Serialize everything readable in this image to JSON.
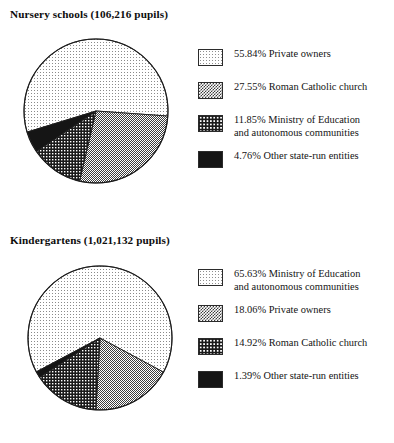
{
  "page": {
    "background": "#ffffff",
    "ink": "#111111"
  },
  "chart_data": [
    {
      "type": "pie",
      "id": "nursery-schools",
      "title": "Nursery schools (106,216 pupils)",
      "title_subject": "Nursery schools",
      "title_count": "106,216 pupils",
      "total_pupils": 106216,
      "legend_position": "right",
      "start_angle_deg": 163,
      "direction": "clockwise",
      "categories": [
        "Private owners",
        "Roman Catholic church",
        "Ministry of Education and autonomous communities",
        "Other state-run entities"
      ],
      "values": [
        55.84,
        27.55,
        11.85,
        4.76
      ],
      "value_labels": [
        "55.84%",
        "27.55%",
        "11.85%",
        "4.76%"
      ],
      "units": "percent",
      "slices": [
        {
          "label": "Private owners",
          "value": 55.84,
          "value_label": "55.84%",
          "pattern": "light-dots",
          "fill": "#e3e3e3"
        },
        {
          "label": "Roman Catholic church",
          "value": 27.55,
          "value_label": "27.55%",
          "pattern": "medium-checker",
          "fill": "#9a9a9a"
        },
        {
          "label": "Ministry of Education and autonomous communities",
          "label_line1": "Ministry of Education",
          "label_line2": "and autonomous communities",
          "value": 11.85,
          "value_label": "11.85%",
          "pattern": "dark-checker",
          "fill": "#3a3a3a"
        },
        {
          "label": "Other state-run entities",
          "value": 4.76,
          "value_label": "4.76%",
          "pattern": "solid-black",
          "fill": "#141414"
        }
      ]
    },
    {
      "type": "pie",
      "id": "kindergartens",
      "title": "Kindergartens (1,021,132 pupils)",
      "title_subject": "Kindergartens",
      "title_count": "1,021,132 pupils",
      "total_pupils": 1021132,
      "legend_position": "right",
      "start_angle_deg": 152,
      "direction": "clockwise",
      "categories": [
        "Ministry of Education and autonomous communities",
        "Private owners",
        "Roman Catholic church",
        "Other state-run entities"
      ],
      "values": [
        65.63,
        18.06,
        14.92,
        1.39
      ],
      "value_labels": [
        "65.63%",
        "18.06%",
        "14.92%",
        "1.39%"
      ],
      "units": "percent",
      "slices": [
        {
          "label": "Ministry of Education and autonomous communities",
          "label_line1": "Ministry of Education",
          "label_line2": "and autonomous communities",
          "value": 65.63,
          "value_label": "65.63%",
          "pattern": "light-dots",
          "fill": "#e3e3e3"
        },
        {
          "label": "Private owners",
          "value": 18.06,
          "value_label": "18.06%",
          "pattern": "medium-checker",
          "fill": "#9a9a9a"
        },
        {
          "label": "Roman Catholic church",
          "value": 14.92,
          "value_label": "14.92%",
          "pattern": "dark-checker",
          "fill": "#3a3a3a"
        },
        {
          "label": "Other state-run entities",
          "value": 1.39,
          "value_label": "1.39%",
          "pattern": "solid-black",
          "fill": "#141414"
        }
      ]
    }
  ],
  "nursery": {
    "title": "Nursery schools (106,216 pupils)",
    "legend": [
      {
        "text": "55.84%  Private owners"
      },
      {
        "text": "27.55%  Roman Catholic church"
      },
      {
        "text": "11.85%  Ministry of Education\nand autonomous communities"
      },
      {
        "text": "4.76%  Other state-run entities"
      }
    ]
  },
  "kindergartens": {
    "title": "Kindergartens (1,021,132 pupils)",
    "legend": [
      {
        "text": "65.63%  Ministry of Education\nand autonomous communities"
      },
      {
        "text": "18.06%  Private owners"
      },
      {
        "text": "14.92%  Roman Catholic church"
      },
      {
        "text": "1.39%  Other state-run entities"
      }
    ]
  }
}
